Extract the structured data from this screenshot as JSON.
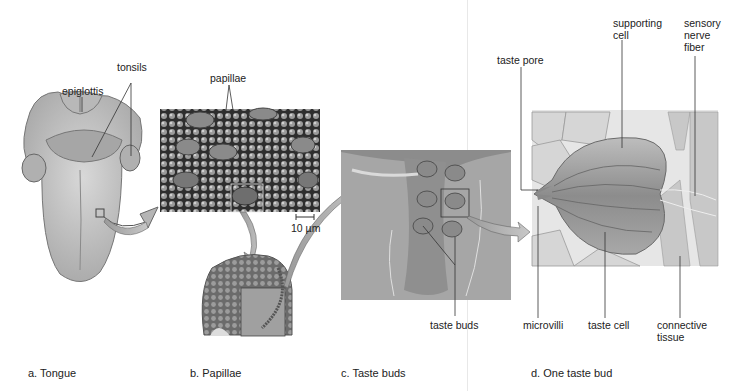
{
  "figure": {
    "panels": [
      {
        "id": "a",
        "caption": "a. Tongue",
        "labels": [
          "epiglottis",
          "tonsils"
        ]
      },
      {
        "id": "b",
        "caption": "b. Papillae",
        "labels": [
          "papillae"
        ],
        "scale_bar": "10 µm"
      },
      {
        "id": "c",
        "caption": "c. Taste buds",
        "labels": [
          "taste buds"
        ]
      },
      {
        "id": "d",
        "caption": "d. One taste bud",
        "labels": [
          "taste pore",
          "supporting cell",
          "sensory nerve fiber",
          "microvilli",
          "taste cell",
          "connective tissue"
        ]
      }
    ],
    "labels": {
      "epiglottis": "epiglottis",
      "tonsils": "tonsils",
      "papillae": "papillae",
      "scale_bar": "10 µm",
      "taste_buds": "taste buds",
      "taste_pore": "taste pore",
      "supporting_cell_1": "supporting",
      "supporting_cell_2": "cell",
      "sensory_1": "sensory",
      "sensory_2": "nerve",
      "sensory_3": "fiber",
      "microvilli": "microvilli",
      "taste_cell": "taste cell",
      "connective_1": "connective",
      "connective_2": "tissue"
    },
    "captions": {
      "a": "a. Tongue",
      "b": "b. Papillae",
      "c": "c. Taste buds",
      "d": "d. One taste bud"
    }
  }
}
